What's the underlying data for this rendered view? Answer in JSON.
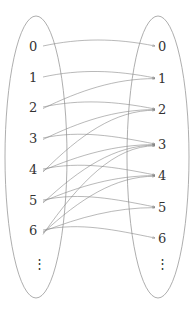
{
  "diagram": {
    "type": "bipartite-mapping",
    "left_set": {
      "labels": [
        "0",
        "1",
        "2",
        "3",
        "4",
        "5",
        "6"
      ],
      "ellipsis": "⋮"
    },
    "right_set": {
      "labels": [
        "0",
        "1",
        "2",
        "3",
        "4",
        "5",
        "6"
      ],
      "ellipsis": "⋮"
    },
    "edges": [
      [
        0,
        0
      ],
      [
        1,
        1
      ],
      [
        2,
        1
      ],
      [
        2,
        2
      ],
      [
        3,
        2
      ],
      [
        3,
        3
      ],
      [
        4,
        2
      ],
      [
        4,
        3
      ],
      [
        4,
        4
      ],
      [
        5,
        3
      ],
      [
        5,
        4
      ],
      [
        5,
        5
      ],
      [
        6,
        3
      ],
      [
        6,
        4
      ],
      [
        6,
        5
      ],
      [
        6,
        6
      ]
    ],
    "colors": {
      "ellipse": "#999999",
      "edge": "#8a8a8a",
      "text": "#333333"
    }
  }
}
